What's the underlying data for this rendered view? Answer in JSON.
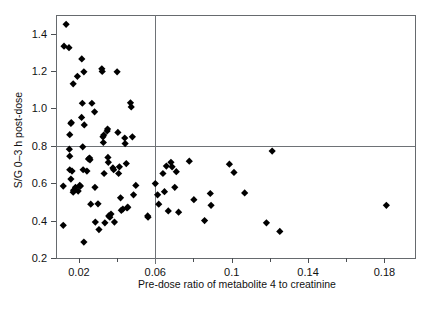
{
  "chart_data": {
    "type": "scatter",
    "title": "",
    "xlabel": "Pre-dose ratio of metabolite 4 to creatinine",
    "ylabel": "S/G 0–3 h post-dose",
    "xlim": [
      0.008,
      0.196
    ],
    "ylim": [
      0.2,
      1.5
    ],
    "xticks": [
      0.02,
      0.06,
      0.1,
      0.14,
      0.18
    ],
    "xticklabels": [
      "0.02",
      "0.06",
      "0.1",
      "0.14",
      "0.18"
    ],
    "xminorticks": [
      0.04,
      0.08,
      0.12,
      0.16
    ],
    "yticks": [
      0.2,
      0.4,
      0.6,
      0.8,
      1.0,
      1.2,
      1.4
    ],
    "yticklabels": [
      "0.2",
      "0.4",
      "0.6",
      "0.8",
      "1.0",
      "1.2",
      "1.4"
    ],
    "grid": false,
    "legend": null,
    "marker": "diamond",
    "marker_color": "#000000",
    "frame_color": "#666a6e",
    "reference_lines": [
      {
        "name": "vertical-cutoff",
        "orientation": "vertical",
        "value": 0.06,
        "color": "#6e7276"
      },
      {
        "name": "horizontal-cutoff",
        "orientation": "horizontal",
        "value": 0.8,
        "color": "#6e7276"
      }
    ],
    "points": [
      [
        0.0122,
        1.333
      ],
      [
        0.0133,
        1.45
      ],
      [
        0.0118,
        0.585
      ],
      [
        0.0118,
        0.375
      ],
      [
        0.0148,
        1.325
      ],
      [
        0.0152,
        0.86
      ],
      [
        0.016,
        0.925
      ],
      [
        0.0158,
        0.92
      ],
      [
        0.0152,
        0.745
      ],
      [
        0.015,
        0.782
      ],
      [
        0.0152,
        0.672
      ],
      [
        0.0164,
        0.665
      ],
      [
        0.0158,
        0.622
      ],
      [
        0.017,
        1.132
      ],
      [
        0.0172,
        0.562
      ],
      [
        0.017,
        0.552
      ],
      [
        0.0182,
        0.578
      ],
      [
        0.0192,
        1.172
      ],
      [
        0.0196,
        0.558
      ],
      [
        0.0204,
        0.588
      ],
      [
        0.0208,
        0.585
      ],
      [
        0.0215,
        1.265
      ],
      [
        0.0218,
        1.028
      ],
      [
        0.0214,
        0.952
      ],
      [
        0.022,
        0.795
      ],
      [
        0.0222,
        0.672
      ],
      [
        0.0226,
        1.196
      ],
      [
        0.0228,
        0.912
      ],
      [
        0.0226,
        0.285
      ],
      [
        0.0242,
        0.665
      ],
      [
        0.025,
        0.73
      ],
      [
        0.0256,
        0.735
      ],
      [
        0.0258,
        0.725
      ],
      [
        0.0262,
        0.488
      ],
      [
        0.0268,
        1.028
      ],
      [
        0.0282,
        0.982
      ],
      [
        0.0284,
        0.578
      ],
      [
        0.0286,
        0.392
      ],
      [
        0.03,
        0.49
      ],
      [
        0.0305,
        0.352
      ],
      [
        0.032,
        1.212
      ],
      [
        0.0322,
        1.198
      ],
      [
        0.0326,
        0.848
      ],
      [
        0.0328,
        0.818
      ],
      [
        0.033,
        0.858
      ],
      [
        0.0332,
        0.652
      ],
      [
        0.0336,
        0.388
      ],
      [
        0.0348,
        0.88
      ],
      [
        0.035,
        0.89
      ],
      [
        0.0352,
        0.738
      ],
      [
        0.0354,
        0.712
      ],
      [
        0.0356,
        0.425
      ],
      [
        0.0362,
        0.418
      ],
      [
        0.0368,
        0.435
      ],
      [
        0.0378,
        0.682
      ],
      [
        0.0382,
        0.672
      ],
      [
        0.0386,
        0.392
      ],
      [
        0.04,
        1.196
      ],
      [
        0.0404,
        0.872
      ],
      [
        0.0408,
        0.652
      ],
      [
        0.0412,
        0.688
      ],
      [
        0.0418,
        0.522
      ],
      [
        0.0422,
        0.455
      ],
      [
        0.043,
        0.462
      ],
      [
        0.044,
        0.842
      ],
      [
        0.0442,
        0.812
      ],
      [
        0.0448,
        0.705
      ],
      [
        0.0452,
        0.468
      ],
      [
        0.0456,
        0.472
      ],
      [
        0.047,
        1.03
      ],
      [
        0.0474,
        1.008
      ],
      [
        0.048,
        0.848
      ],
      [
        0.0486,
        0.538
      ],
      [
        0.0498,
        0.588
      ],
      [
        0.056,
        0.425
      ],
      [
        0.0562,
        0.418
      ],
      [
        0.06,
        0.598
      ],
      [
        0.0612,
        0.538
      ],
      [
        0.0618,
        0.488
      ],
      [
        0.064,
        0.652
      ],
      [
        0.0648,
        0.555
      ],
      [
        0.0658,
        0.692
      ],
      [
        0.0668,
        0.452
      ],
      [
        0.0682,
        0.712
      ],
      [
        0.0688,
        0.688
      ],
      [
        0.0702,
        0.578
      ],
      [
        0.071,
        0.662
      ],
      [
        0.0722,
        0.445
      ],
      [
        0.0778,
        0.718
      ],
      [
        0.0802,
        0.512
      ],
      [
        0.0858,
        0.4
      ],
      [
        0.0888,
        0.545
      ],
      [
        0.0892,
        0.482
      ],
      [
        0.0988,
        0.702
      ],
      [
        0.1012,
        0.658
      ],
      [
        0.1068,
        0.548
      ],
      [
        0.1182,
        0.388
      ],
      [
        0.1212,
        0.772
      ],
      [
        0.1252,
        0.342
      ],
      [
        0.181,
        0.482
      ]
    ]
  }
}
